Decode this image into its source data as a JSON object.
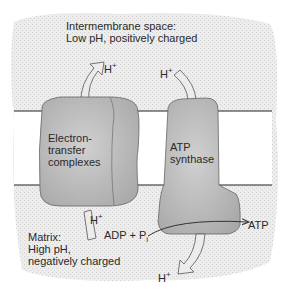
{
  "diagram": {
    "regions": {
      "intermembrane": {
        "line1": "Intermembrane space:",
        "line2": "Low pH, positively charged"
      },
      "matrix": {
        "line1": "Matrix:",
        "line2": "High pH,",
        "line3": "negatively charged"
      }
    },
    "proteins": {
      "etc": {
        "line1": "Electron-",
        "line2": "transfer",
        "line3": "complexes"
      },
      "atp_synthase": {
        "line1": "ATP",
        "line2": "synthase"
      }
    },
    "ions": {
      "h_base": "H",
      "h_charge": "+"
    },
    "reaction": {
      "reactant": "ADP + P",
      "reactant_sub": "i",
      "product": "ATP"
    },
    "colors": {
      "background_stipple": "#e6e6e6",
      "membrane_interior": "#ffffff",
      "membrane_line": "#222222",
      "protein_fill": "#c4c4c4",
      "arrow_fill": "#ececec",
      "text": "#2a2a2a"
    }
  }
}
